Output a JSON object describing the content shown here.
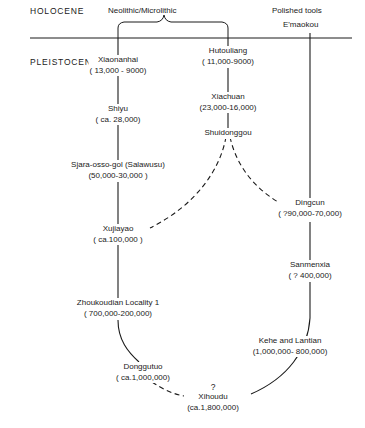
{
  "diagram": {
    "epochs": [
      {
        "label": "HOLOCENE"
      },
      {
        "label": "PLEISTOCENE"
      }
    ],
    "tech_labels": [
      {
        "label": "Neolithic/Microlithic"
      },
      {
        "label": "Polished tools"
      },
      {
        "label": "E'maokou"
      }
    ],
    "nodes": [
      {
        "name": "Xiaonanhai",
        "date": "( 13,000 - 9000)"
      },
      {
        "name": "Shiyu",
        "date": "( ca. 28,000)"
      },
      {
        "name": "Sjara-osso-gol (Salawusu)",
        "date": "(50,000-30,000 )"
      },
      {
        "name": "Xujiayao",
        "date": "( ca.100,000 )"
      },
      {
        "name": "Zhoukoudian Locality 1",
        "date": "( 700,000-200,000)"
      },
      {
        "name": "Donggutuo",
        "date": "( ca.1,000,000)"
      },
      {
        "name": "Hutouliang",
        "date": "( 11,000-9000)"
      },
      {
        "name": "Xiachuan",
        "date": "(23,000-16,000)"
      },
      {
        "name": "Shuidonggou",
        "date": ""
      },
      {
        "name": "Dingcun",
        "date": "( ?90,000-70,000)"
      },
      {
        "name": "Sanmenxia",
        "date": "( ? 400,000)"
      },
      {
        "name": "Kehe and Lantian",
        "date": "(1,000,000- 800,000)"
      },
      {
        "name": "Xihoudu",
        "date": "(ca.1,800,000)"
      }
    ],
    "uncertainty_marker": "?",
    "colors": {
      "ink": "#1a1a1a",
      "background": "#ffffff"
    }
  }
}
